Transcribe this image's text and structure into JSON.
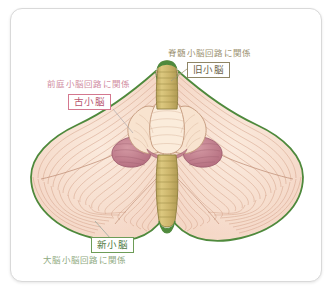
{
  "diagram": {
    "colors": {
      "outline_green": "#4f8a3d",
      "cortex_fill": "#f7ded0",
      "cortex_stripe": "#d9a58c",
      "vermis_fill": "#f6e2cc",
      "flocculus_pink": "#c47d8c",
      "brainstem_khaki": "#cbb46a",
      "card_border": "#d9d9d9",
      "tag_old_border": "#8f8565",
      "tag_archi_border": "#d4788f",
      "tag_neo_border": "#6d9c57"
    }
  },
  "labels": {
    "paleocerebellum": {
      "tag": "旧小脳",
      "caption": "脊髄小脳回路に関係"
    },
    "archicerebellum": {
      "tag": "古小脳",
      "caption": "前庭小脳回路に関係"
    },
    "neocerebellum": {
      "tag": "新小脳",
      "caption": "大脳小脳回路に関係"
    }
  }
}
